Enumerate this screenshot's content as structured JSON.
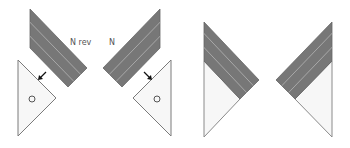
{
  "labels": {
    "n_rev": "N rev",
    "n": "N"
  },
  "colors": {
    "band_fill": "#777777",
    "band_stripe": "#a8a8a8",
    "band_edge": "#555555",
    "triangle_fill": "#f7f7f7",
    "triangle_stroke": "#7a7a7a",
    "arrow": "#111111",
    "circle_stroke": "#555555"
  },
  "shapes": [
    {
      "id": "band-left",
      "kind": "striped-band",
      "points": "30,9 87,68 68,87 30,48"
    },
    {
      "id": "triangle-left",
      "kind": "triangle",
      "points": "18,60 56,98 18,136",
      "circle": [
        32,
        99
      ]
    },
    {
      "id": "band-right",
      "kind": "striped-band",
      "points": "160,9 103,68 122,87 160,48"
    },
    {
      "id": "triangle-right",
      "kind": "triangle",
      "points": "171,60 133,98 171,136",
      "circle": [
        157,
        99
      ]
    },
    {
      "id": "composite-left",
      "kind": "composite",
      "band": "204,22 259,80 240,99 204,61",
      "light": "204,61 240,99 204,137"
    },
    {
      "id": "composite-right",
      "kind": "composite",
      "band": "332,22 276,80 295,99 332,61",
      "light": "332,61 295,99 332,137"
    }
  ]
}
